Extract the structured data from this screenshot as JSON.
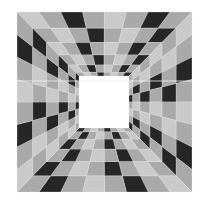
{
  "image": {
    "description": "checkered-tunnel-illusion",
    "outer": {
      "x0": 17,
      "y0": 12,
      "x1": 192,
      "y1": 192
    },
    "inner": {
      "x0": 79,
      "y0": 76,
      "x1": 129,
      "y1": 128
    },
    "rings": 6,
    "segments_per_side": 8,
    "colors": {
      "light": "#cacaca",
      "mid": "#a9a9a9",
      "dark": "#262626",
      "hole": "#ffffff",
      "line": "#e6e6e6"
    }
  }
}
